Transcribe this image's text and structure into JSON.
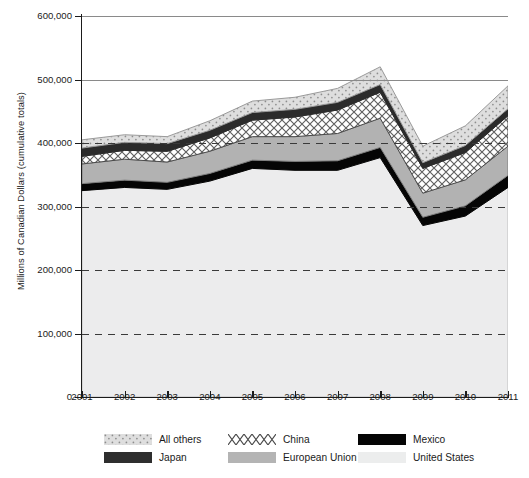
{
  "chart_data": {
    "type": "area",
    "stacked": true,
    "title": "",
    "xlabel": "",
    "ylabel": "Millions of Canadian Dollars (cumulative totals)",
    "categories": [
      "2001",
      "2002",
      "2003",
      "2004",
      "2005",
      "2006",
      "2007",
      "2008",
      "2009",
      "2010",
      "2011"
    ],
    "x": [
      2001,
      2002,
      2003,
      2004,
      2005,
      2006,
      2007,
      2008,
      2009,
      2010,
      2011
    ],
    "ylim": [
      0,
      600000
    ],
    "yticks": [
      0,
      100000,
      200000,
      300000,
      400000,
      500000,
      600000
    ],
    "ytick_labels": [
      "0",
      "100,000",
      "200,000",
      "300,000",
      "400,000",
      "500,000",
      "600,000"
    ],
    "grid": "horizontal-dashed",
    "legend_position": "bottom",
    "series": [
      {
        "name": "United States",
        "values": [
          325000,
          330000,
          327000,
          340000,
          360000,
          357000,
          357000,
          377000,
          270000,
          285000,
          330000
        ]
      },
      {
        "name": "Mexico",
        "values": [
          11000,
          11500,
          11000,
          12000,
          13000,
          14000,
          15000,
          16000,
          13000,
          16000,
          19000
        ]
      },
      {
        "name": "European Union",
        "values": [
          31000,
          33000,
          32000,
          35000,
          37000,
          39000,
          43000,
          46000,
          38000,
          41000,
          46000
        ]
      },
      {
        "name": "China",
        "values": [
          12000,
          14000,
          17000,
          21000,
          26000,
          31000,
          37000,
          41000,
          39000,
          43000,
          48000
        ]
      },
      {
        "name": "Japan",
        "values": [
          13000,
          12500,
          12000,
          12000,
          12000,
          12000,
          12000,
          12000,
          9000,
          11000,
          11000
        ]
      },
      {
        "name": "All others",
        "values": [
          13000,
          12000,
          11000,
          15000,
          18000,
          19000,
          22000,
          28000,
          26000,
          31000,
          36000
        ]
      }
    ],
    "totals": [
      405000,
      413000,
      410000,
      435000,
      466000,
      472000,
      486000,
      520000,
      395000,
      427000,
      490000
    ]
  },
  "axes": {
    "y_title": "Millions of Canadian Dollars (cumulative totals)",
    "y_tick_labels": [
      "600,000",
      "500,000",
      "400,000",
      "300,000",
      "200,000",
      "100,000",
      "0"
    ],
    "x_tick_labels": [
      "2001",
      "2002",
      "2003",
      "2004",
      "2005",
      "2006",
      "2007",
      "2008",
      "2009",
      "2010",
      "2011"
    ]
  },
  "legend": {
    "row1": [
      {
        "label": "All others",
        "swatch": "dotted-light-gray",
        "color": "#dcdcdc"
      },
      {
        "label": "China",
        "swatch": "cross-hatch-white",
        "color": "#ffffff"
      },
      {
        "label": "Mexico",
        "swatch": "solid-black",
        "color": "#050505"
      }
    ],
    "row2": [
      {
        "label": "Japan",
        "swatch": "solid-dark-gray",
        "color": "#2e2e2e"
      },
      {
        "label": "European Union",
        "swatch": "solid-mid-gray",
        "color": "#b4b4b4"
      },
      {
        "label": "United States",
        "swatch": "solid-pale-gray",
        "color": "#eceded"
      }
    ]
  },
  "colors": {
    "united_states": "#eceded",
    "mexico": "#050505",
    "european_union": "#b4b4b4",
    "china": "#ffffff",
    "japan": "#2e2e2e",
    "all_others": "#dcdcdc",
    "axis": "#1b1b1b",
    "gridline": "#3a3a3a"
  }
}
